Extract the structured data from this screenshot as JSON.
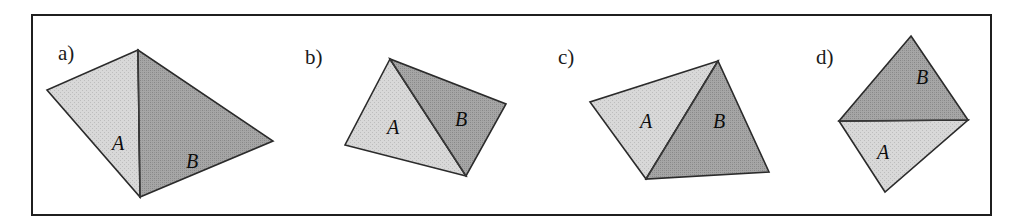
{
  "figure": {
    "caption_labels": [
      "a)",
      "b)",
      "c)",
      "d)"
    ],
    "region_label_a": "A",
    "region_label_b": "B",
    "colors": {
      "light_face": "#d2d2d2",
      "dark_face": "#9c9c9c",
      "outline": "#2b2b2b",
      "frame": "#1f1f1f",
      "background": "#ffffff",
      "text": "#0d0d0d"
    },
    "frame": {
      "x": 31,
      "y": 14,
      "width": 960,
      "height": 201
    },
    "panels": [
      {
        "id": "panel-a",
        "label": "a)",
        "label_pos": {
          "x": 58,
          "y": 60
        },
        "quad": {
          "top": [
            138,
            50
          ],
          "left": [
            47,
            90
          ],
          "bottom": [
            140,
            197
          ],
          "right": [
            273,
            141
          ]
        },
        "light_face": "138,50 47,90 140,197",
        "dark_face": "138,50 140,197 273,141",
        "fold": "138,50 140,197",
        "label_a_pos": {
          "x": 112,
          "y": 150
        },
        "label_b_pos": {
          "x": 186,
          "y": 168
        }
      },
      {
        "id": "panel-b",
        "label": "b)",
        "label_pos": {
          "x": 305,
          "y": 64
        },
        "quad": {
          "top": [
            390,
            59
          ],
          "left": [
            345,
            145
          ],
          "bottom": [
            466,
            176
          ],
          "right": [
            506,
            104
          ]
        },
        "light_face": "390,59 345,145 466,176",
        "dark_face": "390,59 466,176 506,104",
        "fold": "390,59 466,176",
        "label_a_pos": {
          "x": 387,
          "y": 134
        },
        "label_b_pos": {
          "x": 455,
          "y": 126
        }
      },
      {
        "id": "panel-c",
        "label": "c)",
        "label_pos": {
          "x": 558,
          "y": 64
        },
        "quad": {
          "top": [
            718,
            61
          ],
          "left": [
            590,
            102
          ],
          "bottom": [
            646,
            179
          ],
          "right": [
            769,
            172
          ]
        },
        "light_face": "718,61 590,102 646,179",
        "dark_face": "718,61 646,179 769,172",
        "fold": "718,61 646,179",
        "label_a_pos": {
          "x": 640,
          "y": 128
        },
        "label_b_pos": {
          "x": 713,
          "y": 128
        }
      },
      {
        "id": "panel-d",
        "label": "d)",
        "label_pos": {
          "x": 816,
          "y": 64
        },
        "quad": {
          "top": [
            911,
            36
          ],
          "left": [
            839,
            121
          ],
          "bottom": [
            885,
            192
          ],
          "right": [
            968,
            120
          ]
        },
        "light_face": "839,121 968,120 885,192",
        "dark_face": "911,36 968,120 839,121",
        "fold": "839,121 968,120",
        "label_a_pos": {
          "x": 877,
          "y": 159
        },
        "label_b_pos": {
          "x": 916,
          "y": 84
        }
      }
    ]
  }
}
